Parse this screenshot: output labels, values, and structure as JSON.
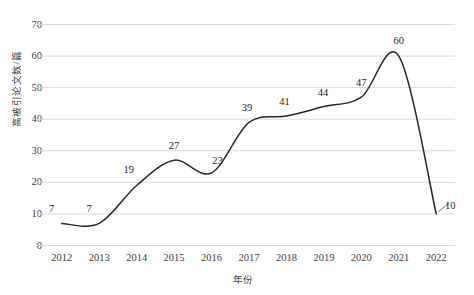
{
  "chart_data": {
    "type": "line",
    "title": "",
    "xlabel": "年份",
    "ylabel": "高被引论文数/篇",
    "categories": [
      "2012",
      "2013",
      "2014",
      "2015",
      "2016",
      "2017",
      "2018",
      "2019",
      "2020",
      "2021",
      "2022"
    ],
    "values": [
      7,
      7,
      19,
      27,
      23,
      39,
      41,
      44,
      47,
      60,
      10
    ],
    "series": [
      {
        "name": "高被引论文数",
        "values": [
          7,
          7,
          19,
          27,
          23,
          39,
          41,
          44,
          47,
          60,
          10
        ]
      }
    ],
    "ylim": [
      0,
      70
    ],
    "yticks": [
      0,
      10,
      20,
      30,
      40,
      50,
      60,
      70
    ],
    "grid": "horizontal",
    "legend": "none",
    "smooth": true,
    "data_labels": [
      "7",
      "7",
      "19",
      "27",
      "23",
      "39",
      "41",
      "44",
      "47",
      "60",
      "10"
    ],
    "line_color": "#262626",
    "grid_color": "#d9d9d9",
    "text_color": "#404040"
  },
  "clipped_title": "",
  "axis": {
    "y_title": "高被引论文数/篇",
    "x_title": "年份"
  }
}
